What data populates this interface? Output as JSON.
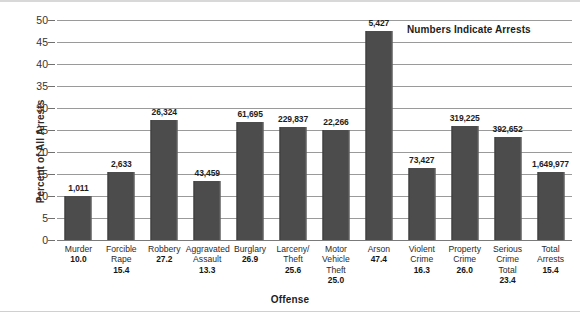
{
  "chart_data": {
    "type": "bar",
    "title": "",
    "xlabel": "Offense",
    "ylabel": "Percent of All Arrests",
    "ylim": [
      0,
      50
    ],
    "yticks": [
      0,
      5,
      10,
      15,
      20,
      25,
      30,
      35,
      40,
      45,
      50
    ],
    "grid": true,
    "legend": "none",
    "annotation": "Numbers Indicate Arrests",
    "bar_color": "#4c4c4c",
    "categories": [
      "Murder",
      "Forcible Rape",
      "Robbery",
      "Aggravated Assault",
      "Burglary",
      "Larceny/ Theft",
      "Motor Vehicle Theft",
      "Arson",
      "Violent Crime",
      "Property Crime",
      "Serious Crime Total",
      "Total Arrests"
    ],
    "category_lines": [
      [
        "Murder"
      ],
      [
        "Forcible",
        "Rape"
      ],
      [
        "Robbery"
      ],
      [
        "Aggravated",
        "Assault"
      ],
      [
        "Burglary"
      ],
      [
        "Larceny/",
        "Theft"
      ],
      [
        "Motor",
        "Vehicle",
        "Theft"
      ],
      [
        "Arson"
      ],
      [
        "Violent",
        "Crime"
      ],
      [
        "Property",
        "Crime"
      ],
      [
        "Serious",
        "Crime",
        "Total"
      ],
      [
        "Total",
        "Arrests"
      ]
    ],
    "values": [
      10.0,
      15.4,
      27.2,
      13.3,
      26.9,
      25.6,
      25.0,
      47.4,
      16.3,
      26.0,
      23.4,
      15.4
    ],
    "value_labels": [
      "10.0",
      "15.4",
      "27.2",
      "13.3",
      "26.9",
      "25.6",
      "25.0",
      "47.4",
      "16.3",
      "26.0",
      "23.4",
      "15.4"
    ],
    "arrest_labels": [
      "1,011",
      "2,633",
      "26,324",
      "43,459",
      "61,695",
      "229,837",
      "22,266",
      "5,427",
      "73,427",
      "319,225",
      "392,652",
      "1,649,977"
    ]
  }
}
